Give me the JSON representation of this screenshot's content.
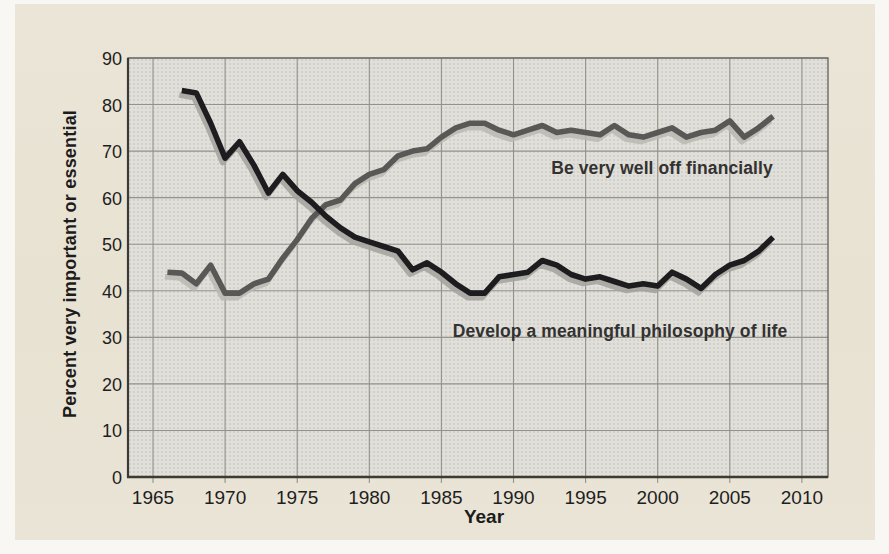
{
  "figure": {
    "kind": "scanned-textbook-line-chart",
    "xlabel": "Year",
    "ylabel": "Percent very important or essential"
  },
  "colors": {
    "page_bg": "#e9e3d5",
    "outer_bg": "#f8f7f3",
    "plot_bg": "#e0dfda",
    "grid": "#94928b",
    "frame": "#6b6965",
    "axis": "#3b3a37",
    "text": "#1e1e1e",
    "label_text": "#333231"
  },
  "chart_data": {
    "type": "line",
    "title": "",
    "xlabel": "Year",
    "ylabel": "Percent very important or essential",
    "xlim": [
      1963.3,
      2011.8
    ],
    "ylim": [
      0,
      90
    ],
    "xticks": [
      1965,
      1970,
      1975,
      1980,
      1985,
      1990,
      1995,
      2000,
      2005,
      2010
    ],
    "yticks": [
      0,
      10,
      20,
      30,
      40,
      50,
      60,
      70,
      80,
      90
    ],
    "grid": true,
    "legend_position": "inline-annotations",
    "series": [
      {
        "name": "Be very well off financially",
        "color": "#595856",
        "shadow_color": "#b9b8b2",
        "years": [
          1966,
          1967,
          1968,
          1969,
          1970,
          1971,
          1972,
          1973,
          1974,
          1975,
          1976,
          1977,
          1978,
          1979,
          1980,
          1981,
          1982,
          1983,
          1984,
          1985,
          1986,
          1987,
          1988,
          1989,
          1990,
          1991,
          1992,
          1993,
          1994,
          1995,
          1996,
          1997,
          1998,
          1999,
          2000,
          2001,
          2002,
          2003,
          2004,
          2005,
          2006,
          2007,
          2008
        ],
        "values": [
          44,
          43.8,
          41.5,
          45.5,
          39.5,
          39.5,
          41.5,
          42.5,
          47,
          51,
          55.5,
          58.5,
          59.5,
          63,
          65,
          66,
          69,
          70,
          70.5,
          73,
          75,
          76,
          76,
          74.5,
          73.5,
          74.5,
          75.5,
          74,
          74.5,
          74,
          73.5,
          75.5,
          73.5,
          73,
          74,
          75,
          73,
          74,
          74.5,
          76.5,
          73,
          75,
          77.5
        ]
      },
      {
        "name": "Develop a meaningful philosophy of life",
        "color": "#1d1c1f",
        "shadow_color": "#a3a29c",
        "years": [
          1967,
          1968,
          1969,
          1970,
          1971,
          1972,
          1973,
          1974,
          1975,
          1976,
          1977,
          1978,
          1979,
          1980,
          1981,
          1982,
          1983,
          1984,
          1985,
          1986,
          1987,
          1988,
          1989,
          1990,
          1991,
          1992,
          1993,
          1994,
          1995,
          1996,
          1997,
          1998,
          1999,
          2000,
          2001,
          2002,
          2003,
          2004,
          2005,
          2006,
          2007,
          2008
        ],
        "values": [
          83,
          82.5,
          76,
          68.5,
          72,
          67,
          61,
          65,
          61.5,
          59,
          56,
          53.5,
          51.5,
          50.5,
          49.5,
          48.5,
          44.5,
          46,
          44,
          41.5,
          39.5,
          39.5,
          43,
          43.5,
          44,
          46.5,
          45.5,
          43.5,
          42.5,
          43,
          42,
          41,
          41.5,
          41,
          44,
          42.5,
          40.5,
          43.5,
          45.5,
          46.5,
          48.5,
          51.5
        ]
      }
    ]
  }
}
